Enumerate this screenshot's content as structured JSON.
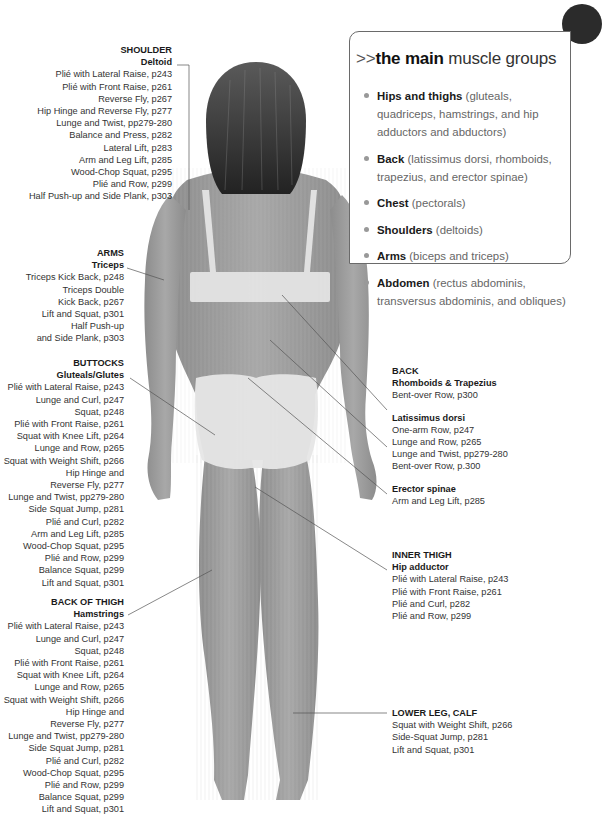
{
  "info_box": {
    "arrows": ">>",
    "heading_bold": "the main",
    "heading_rest": " muscle groups",
    "items": [
      {
        "name": "Hips and thighs",
        "desc": " (gluteals, quadriceps, hamstrings, and hip adductors and abductors)"
      },
      {
        "name": "Back",
        "desc": " (latissimus dorsi, rhomboids, trapezius, and erector spinae)"
      },
      {
        "name": "Chest",
        "desc": " (pectorals)"
      },
      {
        "name": "Shoulders",
        "desc": " (deltoids)"
      },
      {
        "name": "Arms",
        "desc": " (biceps and triceps)"
      },
      {
        "name": "Abdomen",
        "desc": " (rectus abdominis, transversus abdominis, and obliques)"
      }
    ]
  },
  "labels": {
    "shoulder": {
      "title": "SHOULDER",
      "subtitle": "Deltoid",
      "items": [
        "Plié with Lateral Raise, p243",
        "Plié with Front Raise, p261",
        "Reverse Fly, p267",
        "Hip Hinge and Reverse Fly, p277",
        "Lunge and Twist, pp279-280",
        "Balance and Press, p282",
        "Lateral Lift, p283",
        "Arm and Leg Lift, p285",
        "Wood-Chop Squat, p295",
        "Plié and Row, p299",
        "Half Push-up and Side Plank, p303"
      ]
    },
    "arms": {
      "title": "ARMS",
      "subtitle": "Triceps",
      "items": [
        "Triceps Kick Back, p248",
        "Triceps Double",
        "Kick Back, p267",
        "Lift and Squat, p301",
        "Half Push-up",
        "and Side Plank, p303"
      ]
    },
    "buttocks": {
      "title": "BUTTOCKS",
      "subtitle": "Gluteals/Glutes",
      "items": [
        "Plié with Lateral Raise, p243",
        "Lunge and Curl, p247",
        "Squat, p248",
        "Plié with Front Raise, p261",
        "Squat with Knee Lift, p264",
        "Lunge and Row, p265",
        "Squat with Weight Shift, p266",
        "Hip Hinge and",
        "Reverse Fly, p277",
        "Lunge and Twist, pp279-280",
        "Side Squat Jump, p281",
        "Plié and Curl, p282",
        "Arm and Leg Lift, p285",
        "Wood-Chop Squat, p295",
        "Plié and Row, p299",
        "Balance Squat, p299",
        "Lift and Squat, p301"
      ]
    },
    "back_of_thigh": {
      "title": "BACK OF THIGH",
      "subtitle": "Hamstrings",
      "items": [
        "Plié with Lateral Raise, p243",
        "Lunge and Curl, p247",
        "Squat, p248",
        "Plié with Front Raise, p261",
        "Squat with Knee Lift, p264",
        "Lunge and Row, p265",
        "Squat with Weight Shift, p266",
        "Hip Hinge and",
        "Reverse Fly, p277",
        "Lunge and Twist, pp279-280",
        "Side Squat Jump, p281",
        "Plié and Curl, p282",
        "Wood-Chop Squat, p295",
        "Plié and Row, p299",
        "Balance Squat, p299",
        "Lift and Squat, p301"
      ]
    },
    "back": {
      "title": "BACK",
      "groups": [
        {
          "subtitle": "Rhomboids & Trapezius",
          "items": [
            "Bent-over Row, p300"
          ]
        },
        {
          "subtitle": "Latissimus dorsi",
          "items": [
            "One-arm Row, p247",
            "Lunge and Row, p265",
            "Lunge and Twist, pp279-280",
            "Bent-over Row, p.300"
          ]
        },
        {
          "subtitle": "Erector spinae",
          "items": [
            "Arm and Leg Lift, p285"
          ]
        }
      ]
    },
    "inner_thigh": {
      "title": "INNER THIGH",
      "subtitle": "Hip adductor",
      "items": [
        "Plié with Lateral Raise, p243",
        "Plié with Front Raise, p261",
        "Plié and Curl, p282",
        "Plié and Row, p299"
      ]
    },
    "lower_leg": {
      "title": "LOWER LEG, CALF",
      "items": [
        "Squat with Weight Shift, p266",
        "Side-Squat Jump, p281",
        "Lift and Squat, p301"
      ]
    }
  },
  "colors": {
    "text": "#2a2a2a",
    "leader_line": "#555555",
    "box_border": "#6a6a6a",
    "bullet": "#999999",
    "body_skin": "#9a9a9a",
    "underwear": "#e6e6e6",
    "hair": "#3a3a3a"
  }
}
